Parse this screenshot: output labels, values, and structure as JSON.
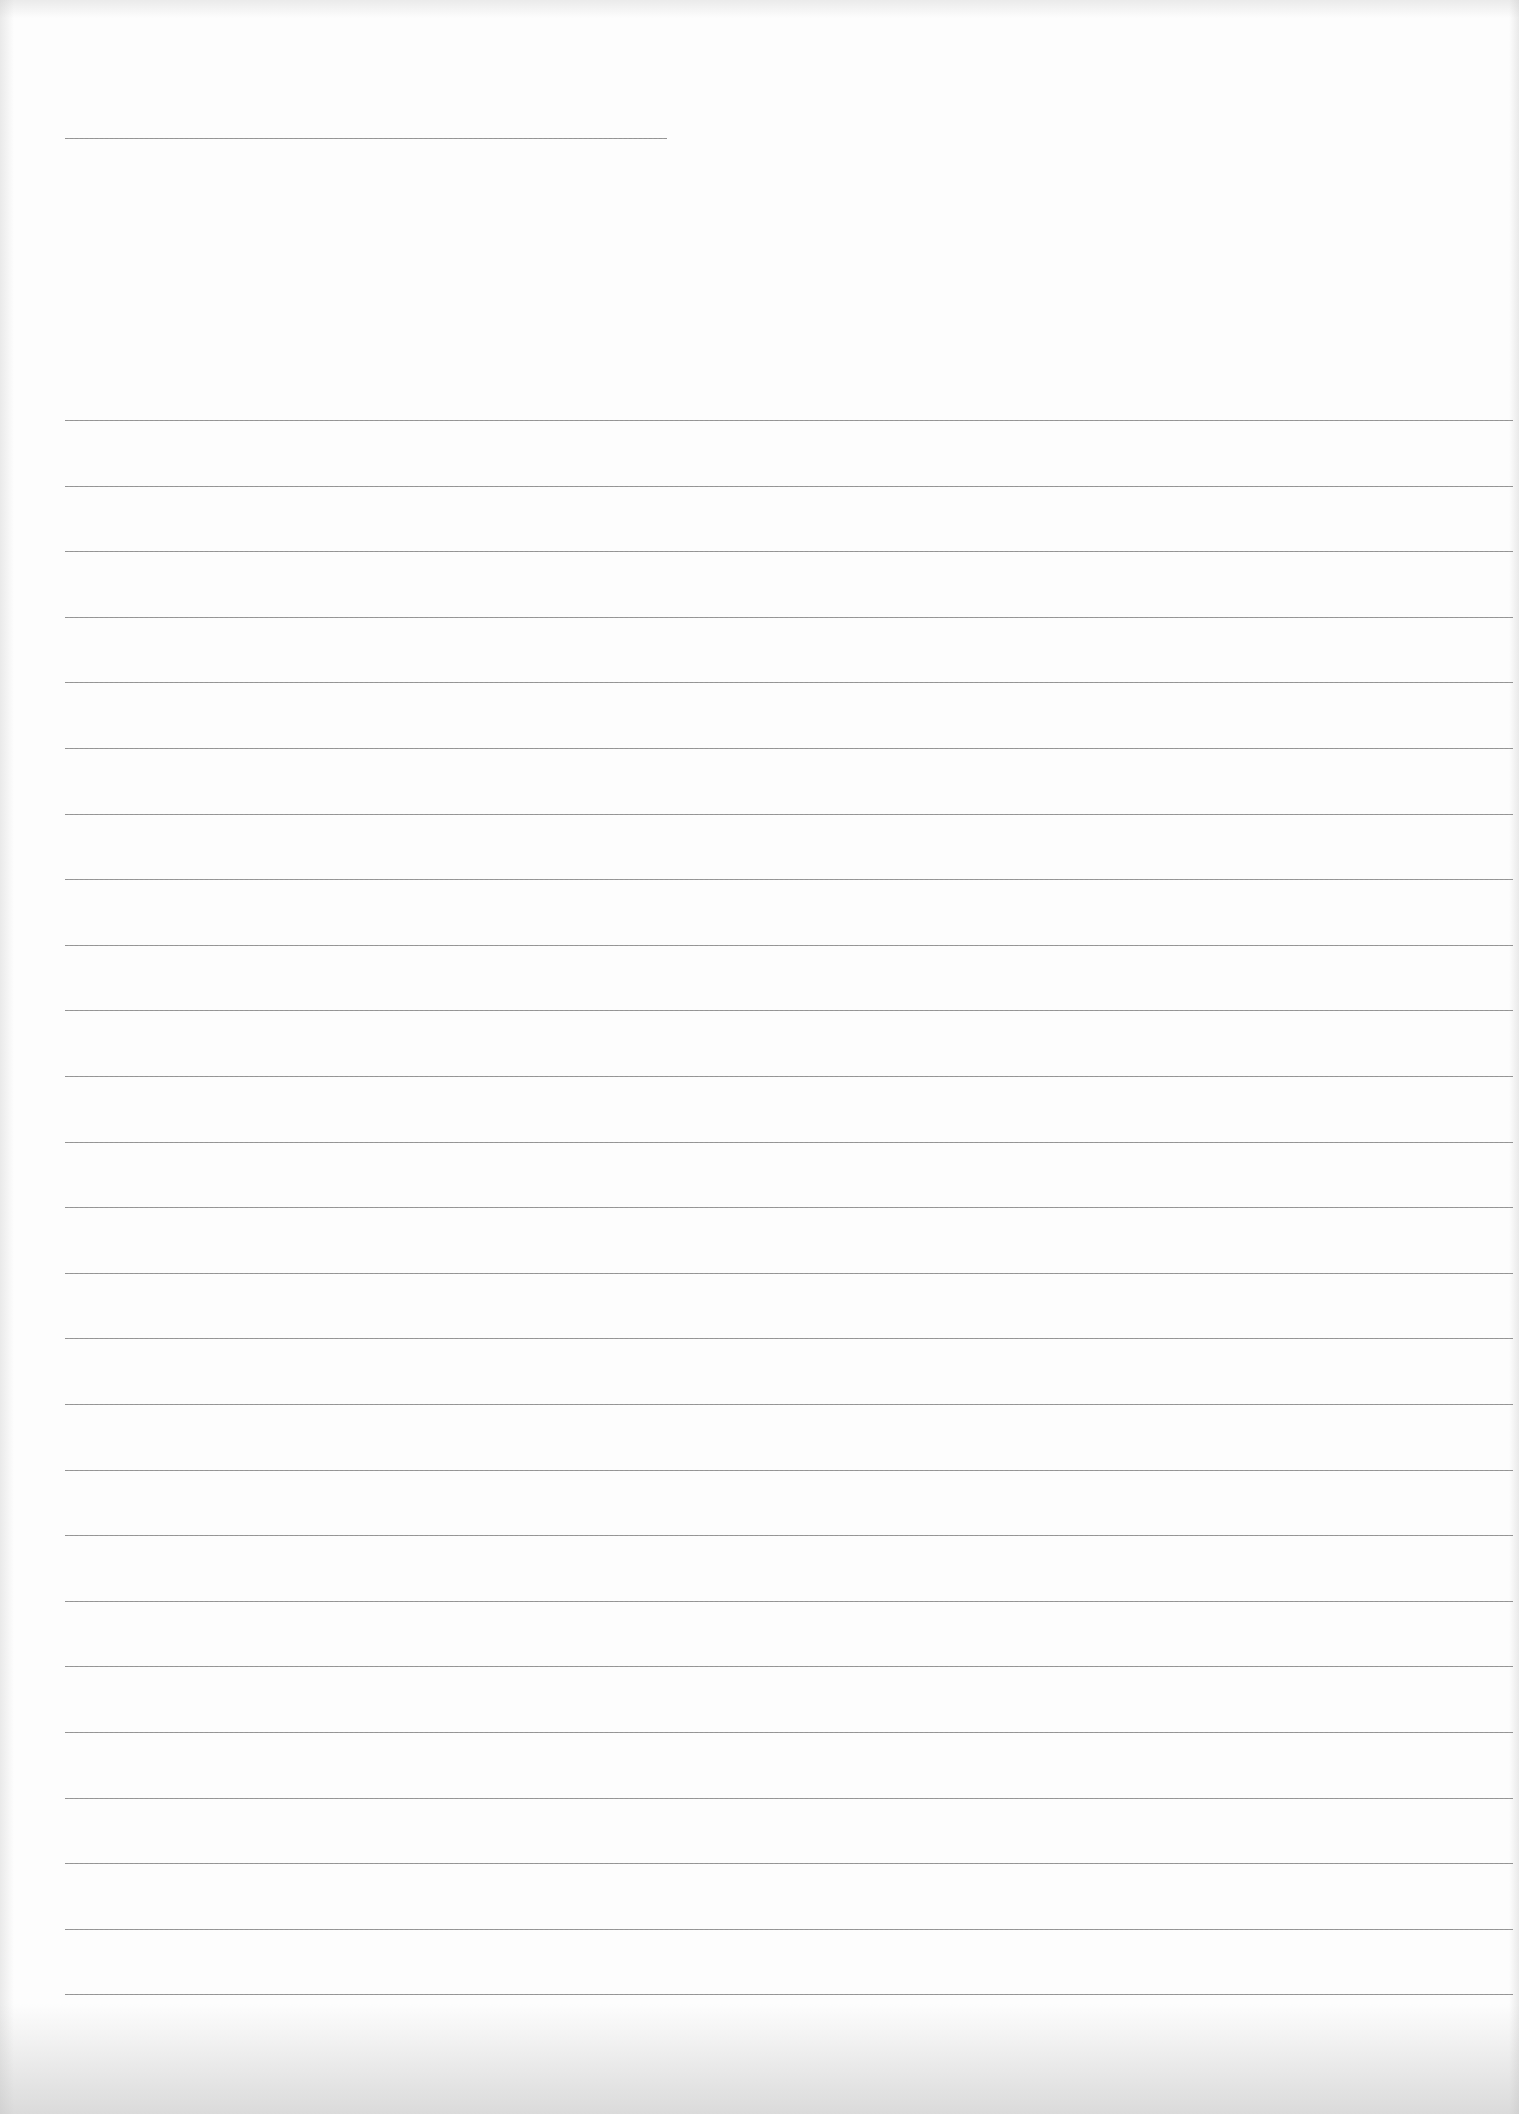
{
  "page": {
    "width": 1519,
    "height": 2114,
    "background": "#fdfdfd",
    "rule_color": "#8a8a8a"
  },
  "title_line": {
    "x": 65,
    "y": 138,
    "width": 602
  },
  "ruled_lines": {
    "x": 65,
    "width": 1448,
    "first_y": 420,
    "spacing": 65.6,
    "count": 25
  }
}
